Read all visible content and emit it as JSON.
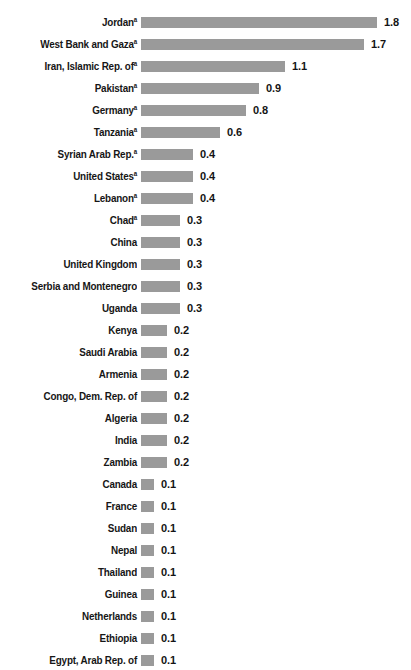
{
  "chart_data": {
    "type": "bar",
    "orientation": "horizontal",
    "title": "",
    "subtitle": "",
    "xlabel": "",
    "ylabel": "",
    "xlim": [
      0,
      1.8
    ],
    "grid": false,
    "legend": null,
    "bar_color": "#9a9a9a",
    "text_color": "#161616",
    "background_color": "#ffffff",
    "footnote_marker": "a",
    "categories": [
      "Jordan",
      "West Bank and Gaza",
      "Iran, Islamic Rep. of",
      "Pakistan",
      "Germany",
      "Tanzania",
      "Syrian Arab Rep.",
      "United States",
      "Lebanon",
      "Chad",
      "China",
      "United Kingdom",
      "Serbia and Montenegro",
      "Uganda",
      "Kenya",
      "Saudi Arabia",
      "Armenia",
      "Congo, Dem. Rep. of",
      "Algeria",
      "India",
      "Zambia",
      "Canada",
      "France",
      "Sudan",
      "Nepal",
      "Thailand",
      "Guinea",
      "Netherlands",
      "Ethiopia",
      "Egypt, Arab Rep. of"
    ],
    "values": [
      1.8,
      1.7,
      1.1,
      0.9,
      0.8,
      0.6,
      0.4,
      0.4,
      0.4,
      0.3,
      0.3,
      0.3,
      0.3,
      0.3,
      0.2,
      0.2,
      0.2,
      0.2,
      0.2,
      0.2,
      0.2,
      0.1,
      0.1,
      0.1,
      0.1,
      0.1,
      0.1,
      0.1,
      0.1,
      0.1
    ],
    "value_labels": [
      "1.8",
      "1.7",
      "1.1",
      "0.9",
      "0.8",
      "0.6",
      "0.4",
      "0.4",
      "0.4",
      "0.3",
      "0.3",
      "0.3",
      "0.3",
      "0.3",
      "0.2",
      "0.2",
      "0.2",
      "0.2",
      "0.2",
      "0.2",
      "0.2",
      "0.1",
      "0.1",
      "0.1",
      "0.1",
      "0.1",
      "0.1",
      "0.1",
      "0.1",
      "0.1"
    ]
  },
  "rows": [
    {
      "label": "Jordan",
      "sup": "a",
      "value": 1.8,
      "value_label": "1.8"
    },
    {
      "label": "West Bank and Gaza",
      "sup": "a",
      "value": 1.7,
      "value_label": "1.7"
    },
    {
      "label": "Iran, Islamic Rep. of",
      "sup": "a",
      "value": 1.1,
      "value_label": "1.1"
    },
    {
      "label": "Pakistan",
      "sup": "a",
      "value": 0.9,
      "value_label": "0.9"
    },
    {
      "label": "Germany",
      "sup": "a",
      "value": 0.8,
      "value_label": "0.8"
    },
    {
      "label": "Tanzania",
      "sup": "a",
      "value": 0.6,
      "value_label": "0.6"
    },
    {
      "label": "Syrian Arab Rep.",
      "sup": "a",
      "value": 0.4,
      "value_label": "0.4"
    },
    {
      "label": "United States",
      "sup": "a",
      "value": 0.4,
      "value_label": "0.4"
    },
    {
      "label": "Lebanon",
      "sup": "a",
      "value": 0.4,
      "value_label": "0.4"
    },
    {
      "label": "Chad",
      "sup": "a",
      "value": 0.3,
      "value_label": "0.3"
    },
    {
      "label": "China",
      "sup": "",
      "value": 0.3,
      "value_label": "0.3"
    },
    {
      "label": "United Kingdom",
      "sup": "",
      "value": 0.3,
      "value_label": "0.3"
    },
    {
      "label": "Serbia and Montenegro",
      "sup": "",
      "value": 0.3,
      "value_label": "0.3"
    },
    {
      "label": "Uganda",
      "sup": "",
      "value": 0.3,
      "value_label": "0.3"
    },
    {
      "label": "Kenya",
      "sup": "",
      "value": 0.2,
      "value_label": "0.2"
    },
    {
      "label": "Saudi Arabia",
      "sup": "",
      "value": 0.2,
      "value_label": "0.2"
    },
    {
      "label": "Armenia",
      "sup": "",
      "value": 0.2,
      "value_label": "0.2"
    },
    {
      "label": "Congo, Dem. Rep. of",
      "sup": "",
      "value": 0.2,
      "value_label": "0.2"
    },
    {
      "label": "Algeria",
      "sup": "",
      "value": 0.2,
      "value_label": "0.2"
    },
    {
      "label": "India",
      "sup": "",
      "value": 0.2,
      "value_label": "0.2"
    },
    {
      "label": "Zambia",
      "sup": "",
      "value": 0.2,
      "value_label": "0.2"
    },
    {
      "label": "Canada",
      "sup": "",
      "value": 0.1,
      "value_label": "0.1"
    },
    {
      "label": "France",
      "sup": "",
      "value": 0.1,
      "value_label": "0.1"
    },
    {
      "label": "Sudan",
      "sup": "",
      "value": 0.1,
      "value_label": "0.1"
    },
    {
      "label": "Nepal",
      "sup": "",
      "value": 0.1,
      "value_label": "0.1"
    },
    {
      "label": "Thailand",
      "sup": "",
      "value": 0.1,
      "value_label": "0.1"
    },
    {
      "label": "Guinea",
      "sup": "",
      "value": 0.1,
      "value_label": "0.1"
    },
    {
      "label": "Netherlands",
      "sup": "",
      "value": 0.1,
      "value_label": "0.1"
    },
    {
      "label": "Ethiopia",
      "sup": "",
      "value": 0.1,
      "value_label": "0.1"
    },
    {
      "label": "Egypt, Arab Rep. of",
      "sup": "",
      "value": 0.1,
      "value_label": "0.1"
    }
  ],
  "layout": {
    "bar_origin_x": 141,
    "px_per_unit": 131,
    "min_bar_px": 13,
    "row_pitch": 22,
    "first_row_top": 11,
    "bar_height": 11,
    "value_gap": 7
  }
}
